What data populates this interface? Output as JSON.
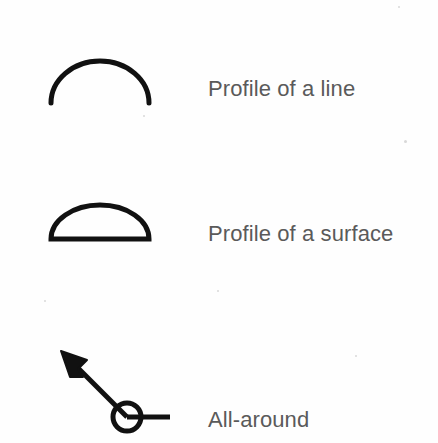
{
  "page": {
    "background_color": "#fefefe",
    "ink_color": "#111111",
    "label_color": "#5a5a5a",
    "width": 438,
    "height": 443
  },
  "legend": {
    "rows": [
      {
        "id": "profile-of-a-line",
        "label": "Profile of a line",
        "symbol_name": "open-arc-symbol",
        "symbol_description": "open semicircular arc, unclosed at the base"
      },
      {
        "id": "profile-of-a-surface",
        "label": "Profile of a surface",
        "symbol_name": "closed-half-circle-symbol",
        "symbol_description": "semicircle closed with a straight horizontal base line"
      },
      {
        "id": "all-around",
        "label": "All-around",
        "symbol_name": "all-around-leader-symbol",
        "symbol_description": "leader line with solid arrowhead and a circle at the bend point"
      }
    ]
  },
  "artifacts": {
    "specks": [
      {
        "x": 143,
        "y": 115,
        "size": 2
      },
      {
        "x": 404,
        "y": 140,
        "size": 3
      },
      {
        "x": 217,
        "y": 290,
        "size": 2
      },
      {
        "x": 44,
        "y": 300,
        "size": 2
      },
      {
        "x": 355,
        "y": 355,
        "size": 2
      },
      {
        "x": 398,
        "y": 6,
        "size": 2
      }
    ]
  }
}
